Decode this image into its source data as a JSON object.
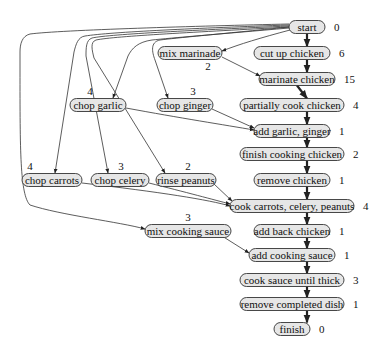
{
  "diagram": {
    "nodes": [
      {
        "id": "start",
        "label": "start",
        "duration": "0",
        "cx": 307,
        "cy": 27,
        "w": 36,
        "dur_side": "right"
      },
      {
        "id": "cut_up_chicken",
        "label": "cut up chicken",
        "duration": "6",
        "cx": 292,
        "cy": 53,
        "w": 76,
        "dur_side": "right"
      },
      {
        "id": "mix_marinade",
        "label": "mix marinade",
        "duration": "2",
        "cx": 190,
        "cy": 53,
        "w": 64,
        "dur_side": "below"
      },
      {
        "id": "marinate_chicken",
        "label": "marinate chicken",
        "duration": "15",
        "cx": 297,
        "cy": 79,
        "w": 76,
        "dur_side": "right"
      },
      {
        "id": "chop_garlic",
        "label": "chop garlic",
        "duration": "4",
        "cx": 98,
        "cy": 105,
        "w": 56,
        "dur_side": "above"
      },
      {
        "id": "chop_ginger",
        "label": "chop ginger",
        "duration": "3",
        "cx": 185,
        "cy": 105,
        "w": 56,
        "dur_side": "above"
      },
      {
        "id": "partially_cook_chicken",
        "label": "partially cook chicken",
        "duration": "4",
        "cx": 292,
        "cy": 105,
        "w": 104,
        "dur_side": "right"
      },
      {
        "id": "add_garlic_ginger",
        "label": "add garlic, ginger",
        "duration": "1",
        "cx": 292,
        "cy": 131,
        "w": 76,
        "dur_side": "right"
      },
      {
        "id": "finish_cooking_chicken",
        "label": "finish cooking chicken",
        "duration": "2",
        "cx": 292,
        "cy": 154,
        "w": 104,
        "dur_side": "right"
      },
      {
        "id": "chop_carrots",
        "label": "chop carrots",
        "duration": "4",
        "cx": 52,
        "cy": 180,
        "w": 60,
        "dur_side": "above"
      },
      {
        "id": "chop_celery",
        "label": "chop celery",
        "duration": "3",
        "cx": 120,
        "cy": 180,
        "w": 58,
        "dur_side": "above"
      },
      {
        "id": "rinse_peanuts",
        "label": "rinse peanuts",
        "duration": "2",
        "cx": 186,
        "cy": 180,
        "w": 60,
        "dur_side": "above"
      },
      {
        "id": "remove_chicken",
        "label": "remove chicken",
        "duration": "1",
        "cx": 292,
        "cy": 180,
        "w": 76,
        "dur_side": "right"
      },
      {
        "id": "cook_carrots_celery_peanuts",
        "label": "cook carrots, celery, peanuts",
        "duration": "4",
        "cx": 292,
        "cy": 206,
        "w": 124,
        "dur_side": "right"
      },
      {
        "id": "mix_cooking_sauce",
        "label": "mix cooking sauce",
        "duration": "3",
        "cx": 188,
        "cy": 231,
        "w": 86,
        "dur_side": "above"
      },
      {
        "id": "add_back_chicken",
        "label": "add back chicken",
        "duration": "1",
        "cx": 292,
        "cy": 231,
        "w": 76,
        "dur_side": "right"
      },
      {
        "id": "add_cooking_sauce",
        "label": "add cooking sauce",
        "duration": "1",
        "cx": 292,
        "cy": 255,
        "w": 86,
        "dur_side": "right"
      },
      {
        "id": "cook_sauce_until_thick",
        "label": "cook sauce until thick",
        "duration": "3",
        "cx": 292,
        "cy": 280,
        "w": 104,
        "dur_side": "right"
      },
      {
        "id": "remove_completed_dish",
        "label": "remove completed dish",
        "duration": "1",
        "cx": 292,
        "cy": 304,
        "w": 104,
        "dur_side": "right"
      },
      {
        "id": "finish",
        "label": "finish",
        "duration": "0",
        "cx": 292,
        "cy": 329,
        "w": 36,
        "dur_side": "right"
      }
    ],
    "critical_path": [
      "start",
      "cut_up_chicken",
      "marinate_chicken",
      "partially_cook_chicken",
      "add_garlic_ginger",
      "finish_cooking_chicken",
      "remove_chicken",
      "cook_carrots_celery_peanuts",
      "add_back_chicken",
      "add_cooking_sauce",
      "cook_sauce_until_thick",
      "remove_completed_dish",
      "finish"
    ],
    "edges": [
      {
        "from": "start",
        "to": "mix_marinade"
      },
      {
        "from": "start",
        "to": "chop_garlic"
      },
      {
        "from": "start",
        "to": "chop_ginger"
      },
      {
        "from": "start",
        "to": "chop_carrots"
      },
      {
        "from": "start",
        "to": "chop_celery"
      },
      {
        "from": "start",
        "to": "rinse_peanuts"
      },
      {
        "from": "start",
        "to": "mix_cooking_sauce"
      },
      {
        "from": "mix_marinade",
        "to": "marinate_chicken"
      },
      {
        "from": "chop_garlic",
        "to": "add_garlic_ginger"
      },
      {
        "from": "chop_ginger",
        "to": "add_garlic_ginger"
      },
      {
        "from": "chop_carrots",
        "to": "cook_carrots_celery_peanuts"
      },
      {
        "from": "chop_celery",
        "to": "cook_carrots_celery_peanuts"
      },
      {
        "from": "rinse_peanuts",
        "to": "cook_carrots_celery_peanuts"
      },
      {
        "from": "mix_cooking_sauce",
        "to": "add_cooking_sauce"
      }
    ],
    "colors": {
      "node_fill": "#e6e6e6",
      "node_stroke": "#333333",
      "edge": "#333333",
      "text": "#111111"
    }
  }
}
